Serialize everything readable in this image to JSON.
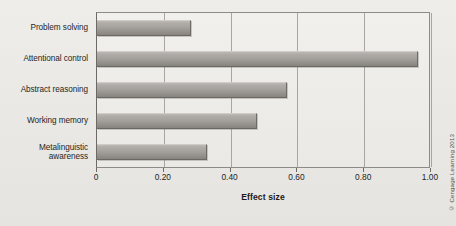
{
  "chart_data": {
    "type": "bar",
    "orientation": "horizontal",
    "title": "",
    "xlabel": "Effect size",
    "ylabel": "",
    "categories": [
      "Problem solving",
      "Attentional control",
      "Abstract reasoning",
      "Working memory",
      "Metalinguistic awareness"
    ],
    "values": [
      0.28,
      0.96,
      0.57,
      0.48,
      0.33
    ],
    "xlim": [
      0,
      1.0
    ],
    "xticks": [
      0,
      0.2,
      0.4,
      0.6,
      0.8,
      1.0
    ],
    "xticklabels": [
      "0",
      "0.20",
      "0.40",
      "0.60",
      "0.80",
      "1.00"
    ],
    "grid": "vertical",
    "legend": "none",
    "series": [
      {
        "name": "Effect size",
        "values": [
          0.28,
          0.96,
          0.57,
          0.48,
          0.33
        ]
      }
    ]
  },
  "category_labels": [
    {
      "lines": [
        "Problem solving"
      ]
    },
    {
      "lines": [
        "Attentional control"
      ]
    },
    {
      "lines": [
        "Abstract reasoning"
      ]
    },
    {
      "lines": [
        "Working memory"
      ]
    },
    {
      "lines": [
        "Metalinguistic",
        "awareness"
      ]
    }
  ],
  "axis": {
    "x_title": "Effect size",
    "tick_labels": [
      "0",
      "0.20",
      "0.40",
      "0.60",
      "0.80",
      "1.00"
    ]
  },
  "credit": {
    "text": "© Cengage Learning 2013"
  },
  "colors": {
    "background": "#eceae6",
    "plot_background": "#eeece9",
    "bar_light": "#bdbab5",
    "bar_dark": "#878480",
    "gridline": "#a9a6a1",
    "axis": "#6d6a66",
    "text": "#231f1e"
  }
}
